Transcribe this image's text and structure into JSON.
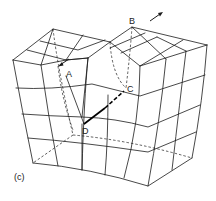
{
  "figure": {
    "panel_label": "(c)",
    "points": {
      "A": "A",
      "B": "B",
      "C": "C",
      "D": "D"
    },
    "arrows": [
      {
        "name": "arrow-near-A",
        "direction": "down-left"
      },
      {
        "name": "arrow-near-B",
        "direction": "up-right"
      }
    ]
  }
}
